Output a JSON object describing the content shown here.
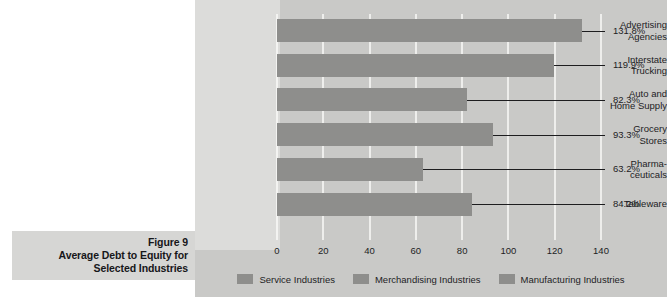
{
  "caption": {
    "figure_number": "Figure 9",
    "line2": "Average Debt to Equity for",
    "line3": "Selected Industries"
  },
  "legend": {
    "items": [
      {
        "label": "Service Industries",
        "color": "#8e8e8c"
      },
      {
        "label": "Merchandising Industries",
        "color": "#8e8e8c"
      },
      {
        "label": "Manufacturing Industries",
        "color": "#8e8e8c"
      }
    ]
  },
  "colors": {
    "panel_background": "#c9c9c7",
    "label_strip": "#dcdcda",
    "caption_background": "#d6d6d4",
    "bar": "#8e8e8c",
    "gridline": "#eeeeec",
    "text": "#1d1d1f"
  },
  "chart_data": {
    "type": "bar",
    "orientation": "horizontal",
    "title": "Average Debt to Equity for Selected Industries",
    "figure_label": "Figure 9",
    "xlabel": "",
    "ylabel": "",
    "xlim": [
      0,
      140
    ],
    "xticks": [
      0,
      20,
      40,
      60,
      80,
      100,
      120,
      140
    ],
    "tick_labels": [
      "0",
      "20",
      "40",
      "60",
      "80",
      "100",
      "120",
      "140"
    ],
    "grid": true,
    "legend_position": "bottom",
    "categories": [
      "Advertising\nAgencies",
      "Interstate\nTrucking",
      "Auto and\nHome Supply",
      "Grocery\nStores",
      "Pharma-\nceuticals",
      "Tableware"
    ],
    "values": [
      131.8,
      119.9,
      82.3,
      93.3,
      63.2,
      84.2
    ],
    "value_labels": [
      "131.8%",
      "119.9%",
      "82.3%",
      "93.3%",
      "63.2%",
      "84.2%"
    ],
    "series": [
      {
        "name": "Debt to Equity",
        "values": [
          131.8,
          119.9,
          82.3,
          93.3,
          63.2,
          84.2
        ]
      }
    ],
    "legend_entries": [
      "Service Industries",
      "Merchandising Industries",
      "Manufacturing Industries"
    ]
  }
}
